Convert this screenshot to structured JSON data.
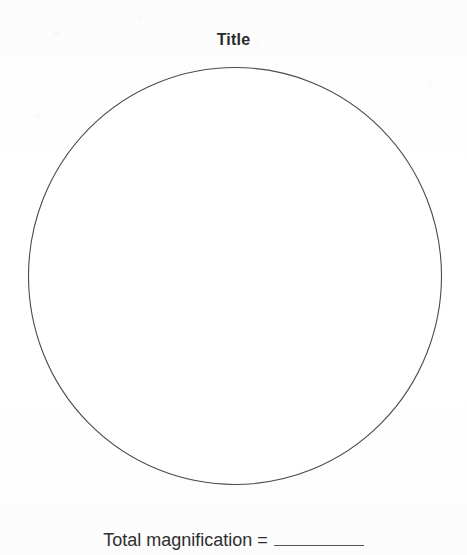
{
  "page": {
    "background_color": "#ffffff",
    "ink_color": "#2f2f2f",
    "line_color": "#4b4b4b",
    "width": 467,
    "height": 555
  },
  "title": {
    "text": "Title"
  },
  "drawing_area": {
    "shape": "circle",
    "label": "field-of-view-circle",
    "content": "",
    "center_x": 235,
    "center_y": 276,
    "diameter": 416,
    "stroke_color": "#4b4b4b",
    "fill_color": "#ffffff"
  },
  "caption": {
    "label": "Total magnification =",
    "answer_value": "",
    "answer_placeholder": ""
  }
}
